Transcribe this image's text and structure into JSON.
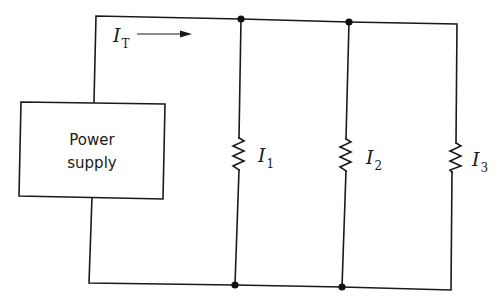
{
  "diagram": {
    "type": "parallel-circuit",
    "power_supply": {
      "label_line1": "Power",
      "label_line2": "supply"
    },
    "total_current": {
      "symbol": "I",
      "subscript": "T",
      "direction": "right"
    },
    "branches": [
      {
        "symbol": "I",
        "subscript": "1",
        "component": "resistor"
      },
      {
        "symbol": "I",
        "subscript": "2",
        "component": "resistor"
      },
      {
        "symbol": "I",
        "subscript": "3",
        "component": "resistor"
      }
    ],
    "colors": {
      "line": "#1a1a1a",
      "background": "#ffffff"
    }
  }
}
